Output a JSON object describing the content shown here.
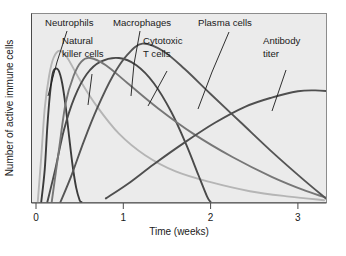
{
  "figure": {
    "background": "#ffffff",
    "plot_background": "#ebebeb",
    "frame_color": "#8c8c8c"
  },
  "chart_data": {
    "type": "line",
    "title": "",
    "xlabel": "Time (weeks)",
    "ylabel": "Number of active immune cells",
    "xlim": [
      0,
      3.35
    ],
    "ylim": [
      0,
      1.0
    ],
    "xticks": [
      0,
      1,
      2,
      3
    ],
    "xtick_labels": [
      "0",
      "1",
      "2",
      "3"
    ],
    "yticks": [],
    "ytick_labels": [],
    "grid": false,
    "legend": "inline-annotations",
    "x_unit": "weeks",
    "y_axis_note": "unitless relative scale, no tick labels shown",
    "series": [
      {
        "name": "Neutrophils",
        "color": "#3b3b3b",
        "width": 1.9,
        "peak_x": 0.22,
        "peak_y": 0.74,
        "points": [
          [
            0.06,
            0.0
          ],
          [
            0.1,
            0.18
          ],
          [
            0.13,
            0.42
          ],
          [
            0.16,
            0.6
          ],
          [
            0.19,
            0.71
          ],
          [
            0.22,
            0.74
          ],
          [
            0.26,
            0.73
          ],
          [
            0.3,
            0.66
          ],
          [
            0.34,
            0.53
          ],
          [
            0.38,
            0.36
          ],
          [
            0.42,
            0.2
          ],
          [
            0.46,
            0.08
          ],
          [
            0.5,
            0.01
          ],
          [
            0.52,
            0.0
          ]
        ]
      },
      {
        "name": "Natural killer cells",
        "color": "#b5b5b5",
        "width": 1.9,
        "peak_x": 0.27,
        "peak_y": 0.84,
        "points": [
          [
            0.02,
            0.0
          ],
          [
            0.06,
            0.25
          ],
          [
            0.1,
            0.52
          ],
          [
            0.15,
            0.7
          ],
          [
            0.2,
            0.8
          ],
          [
            0.27,
            0.84
          ],
          [
            0.36,
            0.8
          ],
          [
            0.5,
            0.68
          ],
          [
            0.7,
            0.53
          ],
          [
            0.95,
            0.38
          ],
          [
            1.25,
            0.26
          ],
          [
            1.6,
            0.17
          ],
          [
            2.0,
            0.11
          ],
          [
            2.45,
            0.06
          ],
          [
            2.9,
            0.03
          ],
          [
            3.3,
            0.01
          ]
        ]
      },
      {
        "name": "Macrophages",
        "color": "#4a4a4a",
        "width": 1.9,
        "peak_x": 0.95,
        "peak_y": 0.8,
        "points": [
          [
            0.13,
            0.0
          ],
          [
            0.22,
            0.18
          ],
          [
            0.32,
            0.4
          ],
          [
            0.44,
            0.58
          ],
          [
            0.58,
            0.71
          ],
          [
            0.74,
            0.78
          ],
          [
            0.95,
            0.8
          ],
          [
            1.15,
            0.76
          ],
          [
            1.35,
            0.66
          ],
          [
            1.55,
            0.5
          ],
          [
            1.72,
            0.32
          ],
          [
            1.86,
            0.15
          ],
          [
            1.96,
            0.03
          ],
          [
            2.0,
            0.0
          ]
        ]
      },
      {
        "name": "Cytotoxic T cells",
        "color": "#777777",
        "width": 1.9,
        "peak_x": 0.62,
        "peak_y": 0.8,
        "points": [
          [
            0.18,
            0.0
          ],
          [
            0.26,
            0.28
          ],
          [
            0.34,
            0.55
          ],
          [
            0.43,
            0.7
          ],
          [
            0.52,
            0.78
          ],
          [
            0.62,
            0.8
          ],
          [
            0.8,
            0.76
          ],
          [
            1.05,
            0.66
          ],
          [
            1.4,
            0.52
          ],
          [
            1.8,
            0.38
          ],
          [
            2.25,
            0.25
          ],
          [
            2.7,
            0.14
          ],
          [
            3.1,
            0.06
          ],
          [
            3.35,
            0.02
          ]
        ]
      },
      {
        "name": "Plasma cells",
        "color": "#555555",
        "width": 1.9,
        "peak_x": 1.22,
        "peak_y": 0.88,
        "points": [
          [
            0.28,
            0.0
          ],
          [
            0.4,
            0.14
          ],
          [
            0.55,
            0.34
          ],
          [
            0.7,
            0.52
          ],
          [
            0.88,
            0.7
          ],
          [
            1.05,
            0.82
          ],
          [
            1.22,
            0.88
          ],
          [
            1.45,
            0.84
          ],
          [
            1.7,
            0.74
          ],
          [
            2.0,
            0.6
          ],
          [
            2.35,
            0.44
          ],
          [
            2.7,
            0.28
          ],
          [
            3.05,
            0.13
          ],
          [
            3.32,
            0.02
          ]
        ]
      },
      {
        "name": "Antibody titer",
        "color": "#4f4f4f",
        "width": 1.9,
        "peak_x": 3.1,
        "peak_y": 0.62,
        "points": [
          [
            0.8,
            0.02
          ],
          [
            1.05,
            0.1
          ],
          [
            1.35,
            0.21
          ],
          [
            1.7,
            0.33
          ],
          [
            2.05,
            0.44
          ],
          [
            2.4,
            0.53
          ],
          [
            2.7,
            0.58
          ],
          [
            3.0,
            0.615
          ],
          [
            3.2,
            0.62
          ],
          [
            3.35,
            0.615
          ]
        ]
      }
    ],
    "annotations": [
      {
        "label": "Neutrophils",
        "lines": [
          "Neutrophils"
        ],
        "text_x": 45,
        "text_y": 26,
        "leader": [
          [
            67,
            31
          ],
          [
            57,
            62
          ],
          [
            48,
            96
          ]
        ]
      },
      {
        "label": "Natural killer cells",
        "lines": [
          "Natural",
          "killer cells"
        ],
        "text_x": 62,
        "text_y": 44,
        "leader": [
          [
            92,
            74
          ],
          [
            88,
            105
          ]
        ]
      },
      {
        "label": "Macrophages",
        "lines": [
          "Macrophages"
        ],
        "text_x": 113,
        "text_y": 26,
        "leader": [
          [
            140,
            31
          ],
          [
            134,
            64
          ],
          [
            131,
            96
          ]
        ]
      },
      {
        "label": "Cytotoxic T cells",
        "lines": [
          "Cytotoxic",
          "T cells"
        ],
        "text_x": 143,
        "text_y": 44,
        "leader": [
          [
            167,
            71
          ],
          [
            148,
            106
          ]
        ]
      },
      {
        "label": "Plasma cells",
        "lines": [
          "Plasma cells"
        ],
        "text_x": 198,
        "text_y": 26,
        "leader": [
          [
            229,
            32
          ],
          [
            212,
            72
          ],
          [
            198,
            109
          ]
        ]
      },
      {
        "label": "Antibody titer",
        "lines": [
          "Antibody",
          "titer"
        ],
        "text_x": 263,
        "text_y": 44,
        "leader": [
          [
            286,
            70
          ],
          [
            272,
            111
          ]
        ]
      }
    ]
  }
}
